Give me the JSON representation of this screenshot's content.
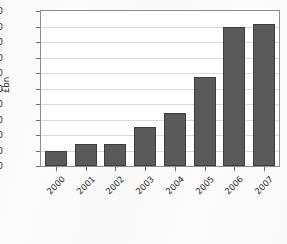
{
  "chart_data": {
    "type": "bar",
    "title": "",
    "xlabel": "",
    "ylabel": "£bn",
    "categories": [
      "2000",
      "2001",
      "2002",
      "2003",
      "2004",
      "2005",
      "2006",
      "2007"
    ],
    "values": [
      20,
      28,
      28,
      51,
      68,
      115,
      179,
      183
    ],
    "ylim": [
      0,
      200
    ],
    "ytick_step": 20,
    "yticks": [
      "200",
      "180",
      "160",
      "140",
      "120",
      "100",
      "80",
      "60",
      "40",
      "20",
      "0"
    ],
    "grid": true,
    "legend": "none",
    "series": [
      {
        "name": "",
        "values": [
          20,
          28,
          28,
          51,
          68,
          115,
          179,
          183
        ]
      }
    ]
  },
  "style": {
    "bar_fill": "#5a5a5a",
    "bar_stroke": "#3d3d3d",
    "gridline_color": "#d9d9d9",
    "plot_border": "#8d8d8d",
    "plot_background": "#ffffff",
    "page_background": "#fcfcfc",
    "text_color": "#2b2b2b"
  }
}
